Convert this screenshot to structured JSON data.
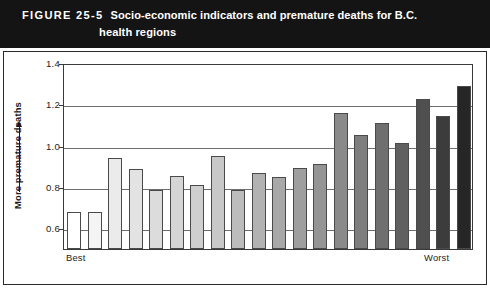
{
  "header": {
    "figure_number": "FIGURE 25-5",
    "title_line1": "Socio-economic indicators and premature deaths for B.C.",
    "title_line2": "health regions",
    "background_color": "#141414",
    "text_color": "#ffffff"
  },
  "axis": {
    "y_label": "More premature deaths",
    "y_arrow": "up-arrow",
    "tick_labels": [
      "1.4",
      "1.2",
      "1.0",
      "0.8",
      "0.6"
    ],
    "x_label_left": "Best",
    "x_label_right": "Worst"
  },
  "chart_data": {
    "type": "bar",
    "title": "Socio-economic indicators and premature deaths for B.C. health regions",
    "xlabel": "",
    "ylabel": "More premature deaths",
    "ylim": [
      0.5,
      1.4
    ],
    "yticks": [
      0.6,
      0.8,
      1.0,
      1.2,
      1.4
    ],
    "grid": true,
    "legend": "none",
    "x_axis_annotations": {
      "left": "Best",
      "right": "Worst"
    },
    "categories": [
      "1",
      "2",
      "3",
      "4",
      "5",
      "6",
      "7",
      "8",
      "9",
      "10",
      "11",
      "12",
      "13",
      "14",
      "15",
      "16",
      "17",
      "18",
      "19",
      "20"
    ],
    "values": [
      0.68,
      0.68,
      0.94,
      0.885,
      0.785,
      0.855,
      0.81,
      0.95,
      0.785,
      0.87,
      0.85,
      0.89,
      0.91,
      1.16,
      1.05,
      1.11,
      1.015,
      1.225,
      1.145,
      1.29
    ],
    "bar_colors": [
      "#ffffff",
      "#f4f4f4",
      "#ebebeb",
      "#e3e3e3",
      "#dcdcdc",
      "#d5d5d5",
      "#cfcfcf",
      "#c8c8c8",
      "#bcbcbc",
      "#b2b2b2",
      "#a8a8a8",
      "#9e9e9e",
      "#949494",
      "#8a8a8a",
      "#7e7e7e",
      "#6f6f6f",
      "#606060",
      "#4f4f4f",
      "#3c3c3c",
      "#262626"
    ]
  }
}
